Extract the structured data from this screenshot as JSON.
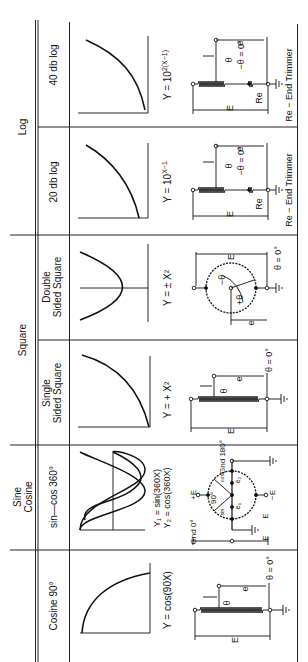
{
  "diagram": {
    "orientation": "rotated 90 degrees counter-clockwise",
    "groups": [
      {
        "label": "Log"
      },
      {
        "label": "Square"
      },
      {
        "label": "Sine Cosine",
        "line1": "Sine",
        "line2": "Cosine"
      },
      {
        "label": ""
      }
    ],
    "columns": [
      {
        "header": "40 db log",
        "equation": "Y = 10²(X−1)",
        "eq_base": "Y = 10",
        "eq_exp": "2(X−1)",
        "circuit": "linear-with-end-trimmer",
        "footer": "Re − End Trimmer",
        "labels": {
          "theta": "θ",
          "theta_zero": "−θ = 0°",
          "e": "e",
          "E": "E",
          "Re": "Re"
        }
      },
      {
        "header": "20 db log",
        "equation": "Y = 10^(X−1)",
        "eq_base": "Y = 10",
        "eq_exp": "X−1",
        "circuit": "linear-with-end-trimmer",
        "footer": "Re − End Trimmer",
        "labels": {
          "theta": "θ",
          "theta_zero": "−θ = 0°",
          "e": "e",
          "E": "E",
          "Re": "Re"
        }
      },
      {
        "header": "Double Sided Square",
        "header1": "Double",
        "header2": "Sided  Square",
        "equation": "Y = ± X²",
        "circuit": "circular",
        "labels": {
          "plus_theta": "+θ",
          "minus_theta": "−θ",
          "theta_zero": "θ = 0°",
          "e": "e",
          "E": "E"
        }
      },
      {
        "header": "Single Sided Square",
        "header1": "Single",
        "header2": "Sided Square",
        "equation": "Y = + X²",
        "circuit": "linear",
        "labels": {
          "theta": "θ",
          "theta_zero": "θ = 0°",
          "e": "e",
          "E": "E"
        }
      },
      {
        "header": "sin—cos 360°",
        "equation1": "Y₁ = sin(360X)",
        "equation2": "Y₂ = cos(360X)",
        "circuit": "circular-sin-cos",
        "labels": {
          "gnd0": "Gnd 0°",
          "gnd180": "Gnd 180°",
          "plusE": "+E",
          "minusE": "−E",
          "deg90": "90°",
          "sin": "sin",
          "cos": "cos",
          "e1": "e₁",
          "e2": "e₂",
          "E": "E"
        }
      },
      {
        "header": "Cosine 90°",
        "equation": "Y = cos(90X)",
        "circuit": "linear",
        "labels": {
          "theta": "θ",
          "theta_zero": "θ = 0°",
          "e": "e",
          "E": "E"
        }
      }
    ]
  }
}
